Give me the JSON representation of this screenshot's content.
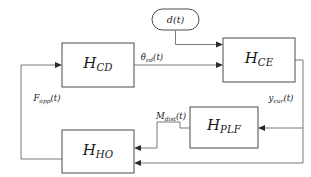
{
  "diagram": {
    "type": "control-block-diagram",
    "background_color": "#ffffff",
    "line_color": "#6b6b6b",
    "box_stroke_color": "#4a4a4a",
    "text_color": "#1a1a1a",
    "blocks": [
      {
        "id": "h-cd",
        "base": "H",
        "subscript": "CD",
        "shape": "rectangle",
        "x": 62,
        "y": 43,
        "w": 72,
        "h": 44
      },
      {
        "id": "h-ce",
        "base": "H",
        "subscript": "CE",
        "shape": "rectangle",
        "x": 223,
        "y": 38,
        "w": 72,
        "h": 44
      },
      {
        "id": "h-plf",
        "base": "H",
        "subscript": "PLF",
        "shape": "rectangle",
        "x": 190,
        "y": 107,
        "w": 68,
        "h": 41
      },
      {
        "id": "h-ho",
        "base": "H",
        "subscript": "HO",
        "shape": "rectangle",
        "x": 62,
        "y": 130,
        "w": 72,
        "h": 43
      }
    ],
    "nodes": [
      {
        "id": "d-node",
        "label": "d(t)",
        "shape": "stadium",
        "x": 152,
        "y": 9,
        "w": 47,
        "h": 21
      }
    ],
    "signals": [
      {
        "id": "theta-cd",
        "base": "θ",
        "subscript": "cd",
        "arg": "(t)",
        "x": 152,
        "y": 58
      },
      {
        "id": "f-app",
        "base": "F",
        "subscript": "app",
        "arg": "(t)",
        "x": 47,
        "y": 99
      },
      {
        "id": "y-cur",
        "base": "y",
        "subscript": "cur",
        "arg": "(t)",
        "x": 281,
        "y": 99
      },
      {
        "id": "m-dist",
        "base": "M",
        "subscript": "dist",
        "arg": "(t)",
        "x": 171,
        "y": 117
      }
    ]
  }
}
